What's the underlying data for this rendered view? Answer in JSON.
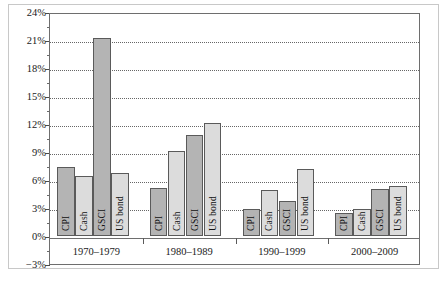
{
  "chart_data": {
    "type": "bar",
    "title": "",
    "subtitle": "",
    "xlabel": "",
    "ylabel": "",
    "categories": [
      "1970–1979",
      "1980–1989",
      "1990–1999",
      "2000–2009"
    ],
    "series": [
      {
        "name": "CPI",
        "values": [
          7.4,
          5.1,
          2.9,
          2.5
        ],
        "color": "#b4b4b4"
      },
      {
        "name": "Cash",
        "values": [
          6.4,
          9.1,
          4.9,
          2.9
        ],
        "color": "#dcdcdc"
      },
      {
        "name": "GSCI",
        "values": [
          21.2,
          10.8,
          3.8,
          5.0
        ],
        "color": "#b4b4b4"
      },
      {
        "name": "US bond",
        "values": [
          6.7,
          12.1,
          7.2,
          5.4
        ],
        "color": "#dcdcdc"
      }
    ],
    "ylim": [
      -3,
      24
    ],
    "ytick_labels": [
      "24%",
      "21%",
      "18%",
      "15%",
      "12%",
      "9%",
      "6%",
      "3%",
      "0%",
      "-3%"
    ],
    "ytick_values": [
      24,
      21,
      18,
      15,
      12,
      9,
      6,
      3,
      0,
      -3
    ],
    "grid": true,
    "grid_style": "dotted-horizontal",
    "legend": "none",
    "bar_labels_inside": true,
    "bar_label_rotation": -90,
    "value_unit": "percent"
  },
  "axis": {
    "y_labels": [
      {
        "text": "24%",
        "value": 24
      },
      {
        "text": "21%",
        "value": 21
      },
      {
        "text": "18%",
        "value": 18
      },
      {
        "text": "15%",
        "value": 15
      },
      {
        "text": "12%",
        "value": 12
      },
      {
        "text": "9%",
        "value": 9
      },
      {
        "text": "6%",
        "value": 6
      },
      {
        "text": "3%",
        "value": 3
      },
      {
        "text": "0%",
        "value": 0
      },
      {
        "text": "−3%",
        "value": -3
      }
    ]
  },
  "groups": [
    {
      "label": "1970–1979",
      "bars": [
        {
          "name": "CPI",
          "value": 7.4,
          "shade": "dark"
        },
        {
          "name": "Cash",
          "value": 6.4,
          "shade": "light"
        },
        {
          "name": "GSCI",
          "value": 21.2,
          "shade": "dark"
        },
        {
          "name": "US bond",
          "value": 6.7,
          "shade": "light"
        }
      ]
    },
    {
      "label": "1980–1989",
      "bars": [
        {
          "name": "CPI",
          "value": 5.1,
          "shade": "dark"
        },
        {
          "name": "Cash",
          "value": 9.1,
          "shade": "light"
        },
        {
          "name": "GSCI",
          "value": 10.8,
          "shade": "dark"
        },
        {
          "name": "US bond",
          "value": 12.1,
          "shade": "light"
        }
      ]
    },
    {
      "label": "1990–1999",
      "bars": [
        {
          "name": "CPI",
          "value": 2.9,
          "shade": "dark"
        },
        {
          "name": "Cash",
          "value": 4.9,
          "shade": "light"
        },
        {
          "name": "GSCI",
          "value": 3.8,
          "shade": "dark"
        },
        {
          "name": "US bond",
          "value": 7.2,
          "shade": "light"
        }
      ]
    },
    {
      "label": "2000–2009",
      "bars": [
        {
          "name": "CPI",
          "value": 2.5,
          "shade": "dark"
        },
        {
          "name": "Cash",
          "value": 2.9,
          "shade": "light"
        },
        {
          "name": "GSCI",
          "value": 5.0,
          "shade": "dark"
        },
        {
          "name": "US bond",
          "value": 5.4,
          "shade": "light"
        }
      ]
    }
  ],
  "colors": {
    "bar_dark": "#b4b4b4",
    "bar_light": "#dcdcdc",
    "bar_border": "#5a5a5a",
    "grid": "#666666",
    "axis": "#6e6e6e",
    "frame": "#c8c8c8",
    "text": "#1a1a1a"
  }
}
